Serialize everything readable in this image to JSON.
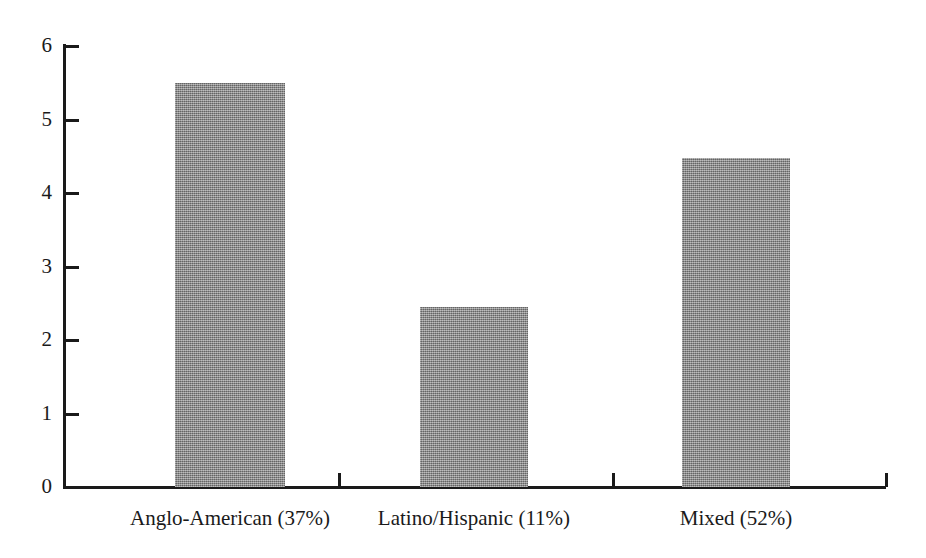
{
  "chart_data": {
    "type": "bar",
    "title": "",
    "subtitle": "",
    "xlabel": "",
    "ylabel": "",
    "categories": [
      "Anglo-American (37%)",
      "Latino/Hispanic (11%)",
      "Mixed (52%)"
    ],
    "values": [
      5.5,
      2.45,
      4.47
    ],
    "ylim": [
      0,
      6
    ],
    "ytick_labels": [
      "0",
      "1",
      "2",
      "3",
      "4",
      "5",
      "6"
    ],
    "ytick_values": [
      0,
      1,
      2,
      3,
      4,
      5,
      6
    ],
    "grid": false,
    "legend": null,
    "legend_position": "none",
    "bar_color": "#8a8a8a",
    "axis_color": "#1a1a1a",
    "background_color": "#ffffff",
    "annotations": []
  },
  "axes": {
    "y_ticks": [
      {
        "label": "6",
        "value": 6
      },
      {
        "label": "5",
        "value": 5
      },
      {
        "label": "4",
        "value": 4
      },
      {
        "label": "3",
        "value": 3
      },
      {
        "label": "2",
        "value": 2
      },
      {
        "label": "1",
        "value": 1
      },
      {
        "label": "0",
        "value": 0
      }
    ],
    "x_categories": [
      {
        "label": "Anglo-American (37%)",
        "value": 5.5
      },
      {
        "label": "Latino/Hispanic (11%)",
        "value": 2.45
      },
      {
        "label": "Mixed (52%)",
        "value": 4.47
      }
    ]
  }
}
